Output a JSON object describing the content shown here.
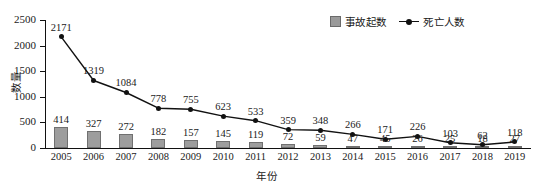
{
  "chart_data": {
    "type": "bar",
    "title": "",
    "xlabel": "年份",
    "ylabel": "数量",
    "ylim": [
      0,
      2500
    ],
    "yticks": [
      0,
      500,
      1000,
      1500,
      2000,
      2500
    ],
    "grid": false,
    "legend_position": "top-right",
    "categories": [
      "2005",
      "2006",
      "2007",
      "2008",
      "2009",
      "2010",
      "2011",
      "2012",
      "2013",
      "2014",
      "2015",
      "2016",
      "2017",
      "2018",
      "2019"
    ],
    "series": [
      {
        "name": "事故起数",
        "type": "bar",
        "color": "#9d9d9d",
        "values": [
          414,
          327,
          272,
          182,
          157,
          145,
          119,
          72,
          59,
          47,
          45,
          26,
          25,
          18,
          27
        ]
      },
      {
        "name": "死亡人数",
        "type": "line",
        "color": "#111111",
        "values": [
          2171,
          1319,
          1084,
          778,
          755,
          623,
          533,
          359,
          348,
          266,
          171,
          226,
          103,
          62,
          118
        ]
      }
    ]
  },
  "legend": {
    "items": [
      {
        "label": "事故起数",
        "marker": "square-swatch"
      },
      {
        "label": "死亡人数",
        "marker": "line-with-dot"
      }
    ]
  },
  "axes": {
    "y_title": "数量",
    "x_title": "年份"
  }
}
